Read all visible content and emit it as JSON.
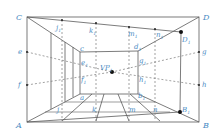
{
  "diagram": {
    "colors": {
      "line": "#5a5a5a",
      "dashed": "#7a7a7a",
      "label": "#4a8cc4",
      "point": "#111111"
    },
    "labels": {
      "C": "C",
      "D": "D",
      "A": "A",
      "B": "B",
      "D1": "D",
      "D1_sub": "1",
      "B1": "B",
      "B1_sub": "1",
      "e": "e",
      "f": "f",
      "g": "g",
      "h": "h",
      "j1": "j",
      "j1_sub": "1",
      "k1": "k",
      "k1_sub": "1",
      "m1": "m",
      "m1_sub": "1",
      "n1": "n",
      "n1_sub": "1",
      "c": "c",
      "d1": "d",
      "d1_sub": "1",
      "e1": "e",
      "e1_sub": "1",
      "f1": "f",
      "f1_sub": "1",
      "g1": "g",
      "g1_sub": "1",
      "h1": "h",
      "h1_sub": "1",
      "a": "a",
      "b1": "b",
      "b1_sub": "1",
      "j": "j",
      "k": "k",
      "m": "m",
      "n": "n",
      "VP": "VP",
      "VP_sub": "1"
    }
  }
}
